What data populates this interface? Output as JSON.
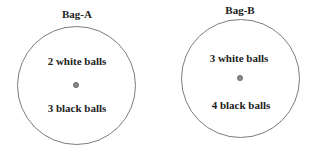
{
  "bags": [
    {
      "name": "Bag-A",
      "white": "2 white balls",
      "black": "3 black balls"
    },
    {
      "name": "Bag-B",
      "white": "3 white balls",
      "black": "4 black balls"
    }
  ]
}
